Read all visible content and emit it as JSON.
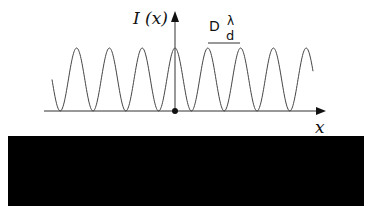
{
  "diagram": {
    "y_axis_label": "I (x)",
    "x_axis_label": "x",
    "fringe_spacing": {
      "prefix": "D",
      "numerator": "λ",
      "denominator": "d"
    },
    "curve": {
      "type": "cos-squared interference pattern",
      "peaks_visible": 8,
      "color": "#333333"
    },
    "origin_marker": "dot"
  },
  "colors": {
    "background": "#ffffff",
    "lines": "#333333",
    "panel": "#000000"
  }
}
